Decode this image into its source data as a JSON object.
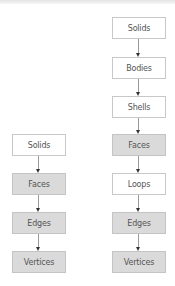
{
  "diagram": {
    "left_column": {
      "nodes": [
        {
          "label": "Solids",
          "style": "white"
        },
        {
          "label": "Faces",
          "style": "gray"
        },
        {
          "label": "Edges",
          "style": "gray"
        },
        {
          "label": "Vertices",
          "style": "gray"
        }
      ]
    },
    "right_column": {
      "nodes": [
        {
          "label": "Solids",
          "style": "white"
        },
        {
          "label": "Bodies",
          "style": "white"
        },
        {
          "label": "Shells",
          "style": "white"
        },
        {
          "label": "Faces",
          "style": "gray"
        },
        {
          "label": "Loops",
          "style": "white"
        },
        {
          "label": "Edges",
          "style": "gray"
        },
        {
          "label": "Vertices",
          "style": "gray"
        }
      ]
    },
    "colors": {
      "white_node": "#ffffff",
      "gray_node": "#dadada",
      "border": "#c8c8c8",
      "arrow": "#333333"
    }
  }
}
